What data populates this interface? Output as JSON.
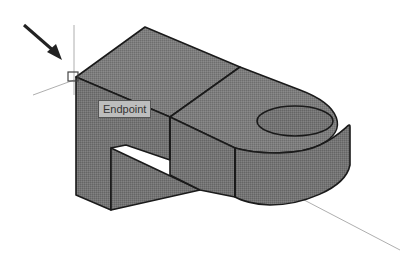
{
  "viewport": {
    "background": "#ffffff",
    "model_fill": "#7a7a7a",
    "model_fill_dark": "#6a6a6a",
    "edge_color": "#1a1a1a",
    "crosshair_color": "#888888"
  },
  "osnap": {
    "tooltip_label": "Endpoint",
    "marker": "endpoint-square"
  },
  "annotation": {
    "arrow": "pointer-arrow"
  }
}
